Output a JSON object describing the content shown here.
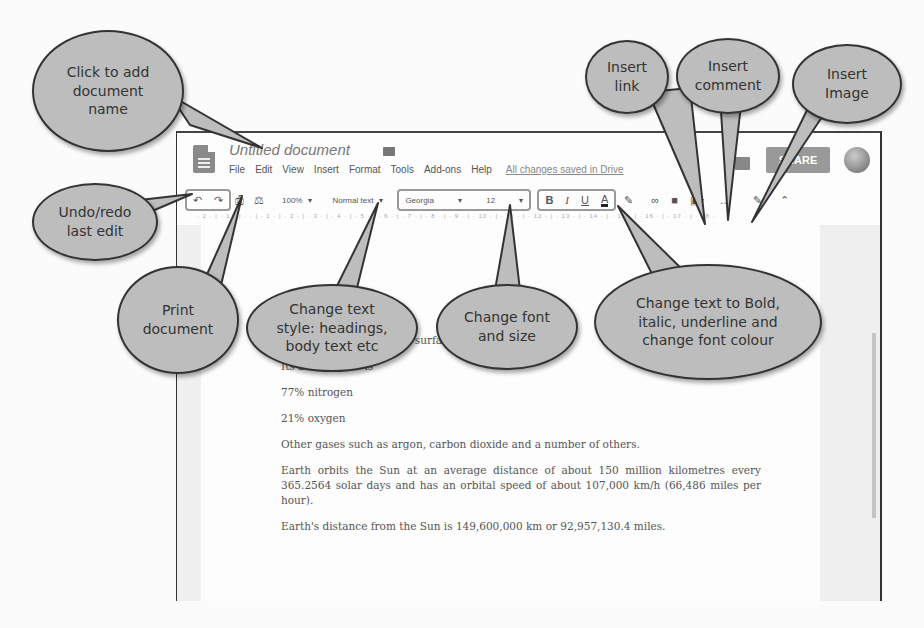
{
  "app": {
    "title": "Untitled document",
    "menu": [
      "File",
      "Edit",
      "View",
      "Insert",
      "Format",
      "Tools",
      "Add-ons",
      "Help"
    ],
    "save_status": "All changes saved in Drive",
    "share_label": "SHARE"
  },
  "toolbar": {
    "undo_icon": "↶",
    "redo_icon": "↷",
    "print_icon": "⎙",
    "paint_format_icon": "⚖",
    "zoom": "100%",
    "style": "Normal text",
    "font": "Georgia",
    "size": "12",
    "bold": "B",
    "italic": "I",
    "underline": "U",
    "text_color": "A",
    "highlight_icon": "✎",
    "link_icon": "∞",
    "comment_icon": "■",
    "image_icon": "▣",
    "more_icon": "…",
    "edit_mode_icon": "✎",
    "collapse_icon": "⌃",
    "dropdown_icon": "▾"
  },
  "ruler": "· 2 · | · 1 · | · · | · 1 · | · 2 · | · 3 · | · 4 · | · 5 · | · 6 · | · 7 · | · 8 · | · 9 · | · 10 · | · 11 · | · 12 · | · 13 · | · 14 · | · 15 · | · 16 · | · 17 · | · 18 ·",
  "document": {
    "paragraphs": [
      "Water covers 71% of the surface.",
      "Its atmosphere is",
      "77% nitrogen",
      "21% oxygen",
      "Other gases such as argon, carbon dioxide and a number of others.",
      "Earth orbits the Sun at an average distance of about 150 million kilometres every 365.2564 solar days and has an orbital speed of about 107,000 km/h (66,486 miles per hour).",
      "Earth's distance from the Sun is 149,600,000 km or 92,957,130.4 miles."
    ]
  },
  "callouts": {
    "doc_name": "Click to add document name",
    "undo_redo": "Undo/redo last edit",
    "print": "Print document",
    "text_style": "Change text style: headings, body text etc",
    "font_size": "Change font and size",
    "formatting": "Change text to Bold, italic, underline and change font colour",
    "insert_link": "Insert link",
    "insert_comment": "Insert comment",
    "insert_image": "Insert Image"
  }
}
